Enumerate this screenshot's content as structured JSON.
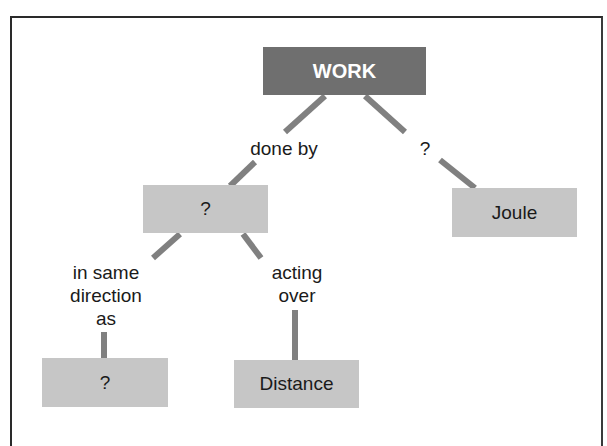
{
  "diagram": {
    "type": "concept-map",
    "colors": {
      "root_fill": "#6f6f6f",
      "node_fill": "#c6c6c6",
      "connector": "#808080",
      "root_text": "#ffffff"
    },
    "nodes": {
      "root": "WORK",
      "agent": "?",
      "unit": "Joule",
      "direction_target": "?",
      "distance": "Distance"
    },
    "links": {
      "root_to_agent": "done by",
      "root_to_unit": "?",
      "agent_to_direction_line1": "in same",
      "agent_to_direction_line2": "direction",
      "agent_to_direction_line3": "as",
      "agent_to_distance_line1": "acting",
      "agent_to_distance_line2": "over"
    }
  }
}
